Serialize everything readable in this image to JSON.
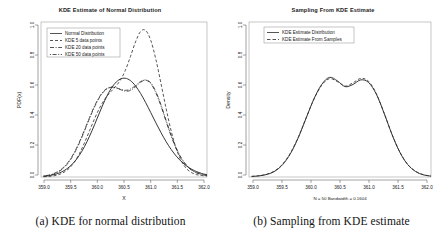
{
  "figure": {
    "panels": [
      {
        "id": "panel-a",
        "title": "KDE Estimate of Normal Distribution",
        "caption": "(a) KDE for normal distribution",
        "xlabel": "X",
        "ylabel": "PDF(x)",
        "subtitle": "",
        "xticks": [
          "359.0",
          "359.5",
          "360.0",
          "360.5",
          "361.0",
          "361.5",
          "362.0"
        ],
        "yticks": [
          "0.0",
          "0.2",
          "0.4",
          "0.6",
          "0.8",
          "1.0"
        ],
        "legend": [
          {
            "label": "Normal Distribution",
            "style": "solid"
          },
          {
            "label": "KDE 5 data points",
            "style": "dashed"
          },
          {
            "label": "KDE 20 data points",
            "style": "dashdot"
          },
          {
            "label": "KDE 50 data points",
            "style": "dotdash"
          }
        ]
      },
      {
        "id": "panel-b",
        "title": "Sampling From KDE Estimate",
        "caption": "(b) Sampling from KDE estimate",
        "xlabel": "",
        "ylabel": "Density",
        "subtitle": "N = 50   Bandwidth = 0.1604",
        "xticks": [
          "359.0",
          "359.5",
          "360.0",
          "360.5",
          "361.0",
          "361.5",
          "362.0"
        ],
        "yticks": [
          "0.0",
          "0.2",
          "0.4",
          "0.6",
          "0.8",
          "1.0"
        ],
        "legend": [
          {
            "label": "KDE Estimate Distribution",
            "style": "solid"
          },
          {
            "label": "KDE Estimate From Samples",
            "style": "dashed"
          }
        ]
      }
    ]
  },
  "chart_data": [
    {
      "type": "line",
      "title": "KDE Estimate of Normal Distribution",
      "xlabel": "X",
      "ylabel": "PDF(x)",
      "xlim": [
        358.85,
        362.1
      ],
      "ylim": [
        0.0,
        1.08
      ],
      "grid": false,
      "legend_position": "top-left",
      "x": [
        358.9,
        359.0,
        359.1,
        359.2,
        359.3,
        359.4,
        359.5,
        359.6,
        359.7,
        359.8,
        359.9,
        360.0,
        360.1,
        360.2,
        360.3,
        360.4,
        360.5,
        360.6,
        360.7,
        360.8,
        360.9,
        361.0,
        361.1,
        361.2,
        361.3,
        361.4,
        361.5,
        361.6,
        361.7,
        361.8,
        361.9,
        362.0,
        362.1
      ],
      "series": [
        {
          "name": "Normal Distribution",
          "style": "solid",
          "values": [
            0.005,
            0.009,
            0.016,
            0.027,
            0.044,
            0.069,
            0.104,
            0.151,
            0.211,
            0.284,
            0.366,
            0.452,
            0.534,
            0.603,
            0.653,
            0.682,
            0.688,
            0.672,
            0.635,
            0.582,
            0.518,
            0.448,
            0.377,
            0.309,
            0.246,
            0.191,
            0.145,
            0.107,
            0.077,
            0.054,
            0.037,
            0.024,
            0.016
          ]
        },
        {
          "name": "KDE 5 data points",
          "style": "dashed",
          "values": [
            0.002,
            0.004,
            0.008,
            0.017,
            0.033,
            0.06,
            0.102,
            0.162,
            0.237,
            0.322,
            0.407,
            0.483,
            0.543,
            0.588,
            0.626,
            0.673,
            0.742,
            0.838,
            0.941,
            1.014,
            1.021,
            0.951,
            0.818,
            0.65,
            0.476,
            0.319,
            0.195,
            0.11,
            0.058,
            0.03,
            0.016,
            0.01,
            0.007
          ]
        },
        {
          "name": "KDE 20 data points",
          "style": "dashdot",
          "values": [
            0.006,
            0.011,
            0.021,
            0.038,
            0.065,
            0.106,
            0.163,
            0.236,
            0.32,
            0.408,
            0.49,
            0.557,
            0.602,
            0.623,
            0.623,
            0.612,
            0.604,
            0.612,
            0.637,
            0.665,
            0.675,
            0.65,
            0.586,
            0.493,
            0.386,
            0.283,
            0.195,
            0.127,
            0.079,
            0.047,
            0.028,
            0.017,
            0.011
          ]
        },
        {
          "name": "KDE 50 data points",
          "style": "dotdash",
          "values": [
            0.007,
            0.013,
            0.024,
            0.042,
            0.07,
            0.112,
            0.17,
            0.243,
            0.327,
            0.414,
            0.496,
            0.562,
            0.606,
            0.626,
            0.624,
            0.61,
            0.598,
            0.603,
            0.628,
            0.66,
            0.676,
            0.656,
            0.594,
            0.502,
            0.394,
            0.29,
            0.2,
            0.131,
            0.082,
            0.049,
            0.029,
            0.018,
            0.012
          ]
        }
      ]
    },
    {
      "type": "line",
      "title": "Sampling From KDE Estimate",
      "xlabel": "",
      "ylabel": "Density",
      "subtitle": "N = 50   Bandwidth = 0.1604",
      "xlim": [
        358.75,
        362.25
      ],
      "ylim": [
        0.0,
        1.05
      ],
      "grid": false,
      "legend_position": "top-left",
      "x": [
        358.8,
        358.95,
        359.1,
        359.25,
        359.4,
        359.55,
        359.7,
        359.85,
        360.0,
        360.15,
        360.3,
        360.45,
        360.6,
        360.75,
        360.9,
        361.05,
        361.2,
        361.35,
        361.5,
        361.65,
        361.8,
        361.95,
        362.1,
        362.25
      ],
      "series": [
        {
          "name": "KDE Estimate Distribution",
          "style": "solid",
          "values": [
            0.004,
            0.008,
            0.018,
            0.04,
            0.085,
            0.16,
            0.268,
            0.4,
            0.53,
            0.628,
            0.675,
            0.651,
            0.612,
            0.627,
            0.658,
            0.64,
            0.56,
            0.43,
            0.288,
            0.168,
            0.085,
            0.038,
            0.015,
            0.006
          ]
        },
        {
          "name": "KDE Estimate From Samples",
          "style": "dashed",
          "values": [
            0.004,
            0.009,
            0.02,
            0.043,
            0.089,
            0.165,
            0.272,
            0.402,
            0.528,
            0.622,
            0.666,
            0.646,
            0.616,
            0.638,
            0.668,
            0.648,
            0.564,
            0.432,
            0.289,
            0.17,
            0.087,
            0.04,
            0.016,
            0.006
          ]
        }
      ]
    }
  ]
}
